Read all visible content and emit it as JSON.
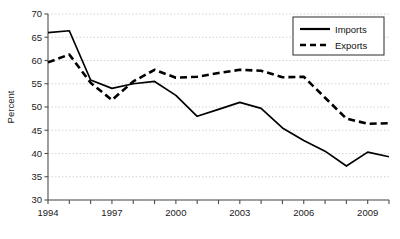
{
  "chart_data": {
    "type": "line",
    "title": "",
    "xlabel": "",
    "ylabel": "Percent",
    "ylim": [
      30,
      70
    ],
    "ytick_step": 5,
    "yticks": [
      30,
      35,
      40,
      45,
      50,
      55,
      60,
      65,
      70
    ],
    "xlim": [
      1994,
      2010
    ],
    "x": [
      1994,
      1995,
      1996,
      1997,
      1998,
      1999,
      2000,
      2001,
      2002,
      2003,
      2004,
      2005,
      2006,
      2007,
      2008,
      2009,
      2010
    ],
    "xticks_labeled": [
      "1994",
      "1997",
      "2000",
      "2003",
      "2006",
      "2009"
    ],
    "xtick_labeled_values": [
      1994,
      1997,
      2000,
      2003,
      2006,
      2009
    ],
    "grid": "horizontal-dotted",
    "legend_position": "top-right",
    "series": [
      {
        "name": "Imports",
        "style": "solid",
        "color": "#000000",
        "values": [
          66.0,
          66.4,
          55.8,
          54.0,
          55.0,
          55.5,
          52.5,
          48.0,
          49.5,
          51.0,
          49.7,
          45.5,
          42.8,
          40.5,
          37.3,
          40.3,
          39.3
        ]
      },
      {
        "name": "Exports",
        "style": "dashed",
        "color": "#000000",
        "values": [
          59.6,
          61.3,
          55.2,
          51.5,
          55.5,
          58.0,
          56.3,
          56.5,
          57.3,
          58.0,
          57.8,
          56.4,
          56.5,
          52.0,
          47.5,
          46.4,
          46.5
        ]
      }
    ]
  },
  "legend": {
    "items": [
      {
        "label": "Imports",
        "style": "solid"
      },
      {
        "label": "Exports",
        "style": "dashed"
      }
    ]
  },
  "colors": {
    "series_line": "#000000",
    "axis": "#4d4d4d",
    "grid": "#c8c8c8",
    "text": "#1a1a1a",
    "background": "#ffffff"
  }
}
